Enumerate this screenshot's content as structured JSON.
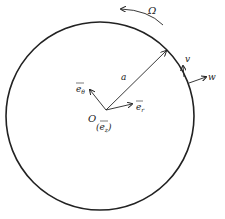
{
  "diagram": {
    "rotation_label": "Ω",
    "radius_label": "a",
    "origin_label": "O",
    "e_theta_label": "e",
    "e_theta_sub": "θ",
    "e_r_label": "e",
    "e_r_sub": "r",
    "e_z_label": "(e",
    "e_z_sub": "z",
    "e_z_close": ")",
    "v_label": "v",
    "w_label": "w",
    "colors": {
      "stroke": "#222222",
      "background": "#ffffff"
    }
  }
}
